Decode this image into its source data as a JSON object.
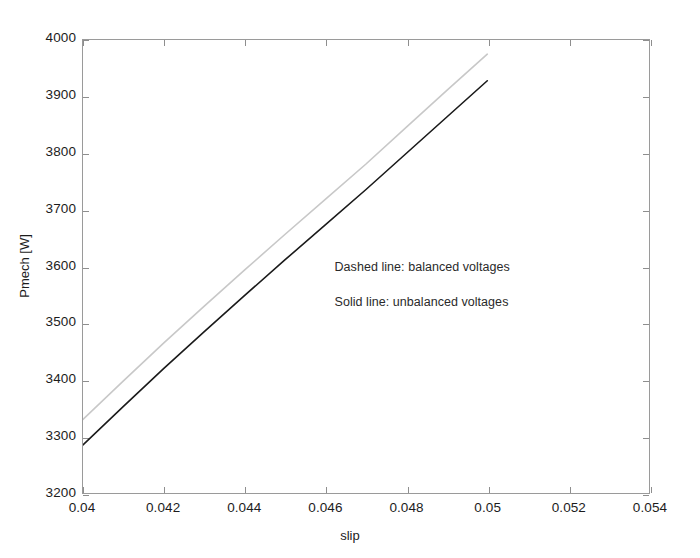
{
  "chart_data": {
    "type": "line",
    "title": "",
    "subtitle": "",
    "xlabel": "slip",
    "ylabel": "Pmech [W]",
    "xlim": [
      0.04,
      0.054
    ],
    "ylim": [
      3200,
      4000
    ],
    "xticks": [
      0.04,
      0.042,
      0.044,
      0.046,
      0.048,
      0.05,
      0.052,
      0.054
    ],
    "xticklabels": [
      "0.04",
      "0.042",
      "0.044",
      "0.046",
      "0.048",
      "0.05",
      "0.052",
      "0.054"
    ],
    "yticks": [
      3200,
      3300,
      3400,
      3500,
      3600,
      3700,
      3800,
      3900,
      4000
    ],
    "yticklabels": [
      "3200",
      "3300",
      "3400",
      "3500",
      "3600",
      "3700",
      "3800",
      "3900",
      "4000"
    ],
    "grid": false,
    "legend_position": "inside-annotation",
    "x": [
      0.04,
      0.041,
      0.042,
      0.043,
      0.044,
      0.045,
      0.046,
      0.047,
      0.048,
      0.049,
      0.05
    ],
    "series": [
      {
        "name": "balanced voltages",
        "style": "dashed",
        "color": "#c8c8c8",
        "values": [
          3330,
          3398,
          3465,
          3530,
          3594,
          3657,
          3719,
          3781,
          3846,
          3911,
          3975
        ]
      },
      {
        "name": "unbalanced voltages",
        "style": "solid",
        "color": "#1a1a1a",
        "values": [
          3285,
          3353,
          3420,
          3485,
          3549,
          3612,
          3674,
          3736,
          3800,
          3864,
          3928
        ]
      }
    ],
    "annotations": [
      {
        "text": "Dashed line: balanced voltages",
        "x": 0.0462,
        "y": 3600
      },
      {
        "text": "Solid line: unbalanced voltages",
        "x": 0.0462,
        "y": 3538
      }
    ]
  },
  "figure": {
    "background_color": "#ffffff",
    "axis_color": "#9a9a9a",
    "text_color": "#1c1c1c"
  }
}
